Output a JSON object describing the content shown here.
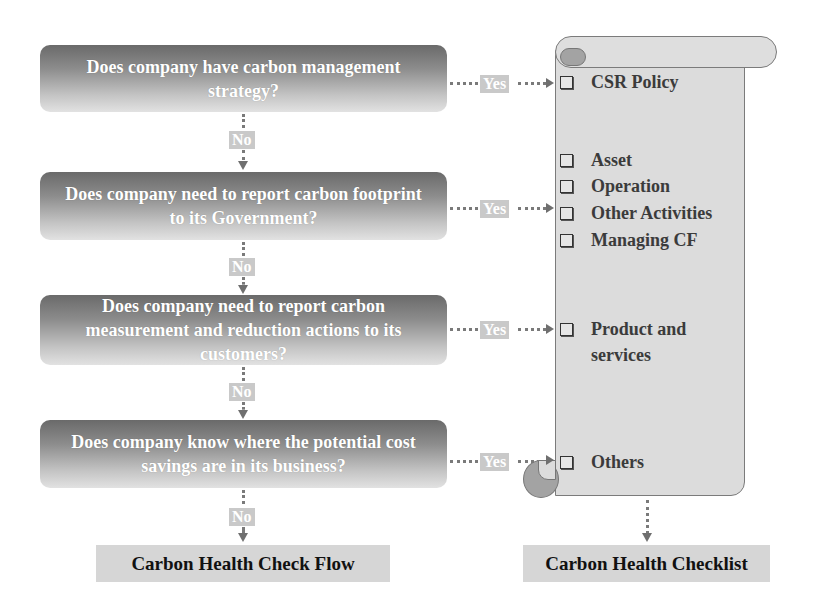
{
  "flow": {
    "questions": [
      {
        "text": "Does company have carbon management strategy?",
        "yes_label": "Yes",
        "no_label": "No"
      },
      {
        "text": "Does company need to report carbon footprint to its Government?",
        "yes_label": "Yes",
        "no_label": "No"
      },
      {
        "text": "Does company need to report carbon measurement and reduction actions to its customers?",
        "yes_label": "Yes",
        "no_label": "No"
      },
      {
        "text": "Does company  know where the potential cost savings are in its business?",
        "yes_label": "Yes",
        "no_label": "No"
      }
    ],
    "footer_label": "Carbon Health Check Flow"
  },
  "checklist": {
    "items": [
      {
        "text": "CSR Policy"
      },
      {
        "text": "Asset"
      },
      {
        "text": "Operation"
      },
      {
        "text": "Other Activities"
      },
      {
        "text": "Managing CF"
      },
      {
        "text": "Product and services"
      },
      {
        "text": "Others"
      }
    ],
    "footer_label": "Carbon Health Checklist"
  },
  "colors": {
    "box_dark": "#6a6a6a",
    "box_light": "#e2e2e2",
    "tag_bg": "#c9c9c9",
    "scroll_fill": "#dcdcdc",
    "scroll_border": "#7b7b7b",
    "curl_fill": "#a3a3a3"
  }
}
